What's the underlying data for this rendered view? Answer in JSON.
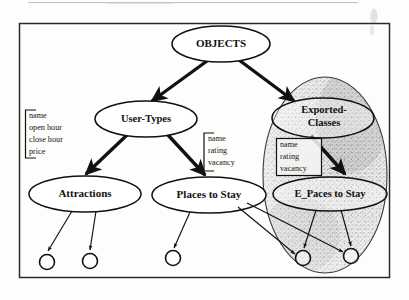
{
  "figure": {
    "kind": "object-hierarchy-diagram",
    "background_color": "#fdfdfc",
    "ink_color": "#111111",
    "shade_color": "#9a9a9a"
  },
  "frame": {
    "name": "outer-border",
    "x": 19,
    "y": 23,
    "width": 371,
    "height": 255
  },
  "scan_artifacts": {
    "top_rule_label": "",
    "top_right_smudge_label": ""
  },
  "nodes": [
    {
      "id": "objects",
      "label": "OBJECTS",
      "cx": 221,
      "cy": 44,
      "rx": 49,
      "ry": 18,
      "font_size": 11,
      "shaded": false,
      "lines": [
        "OBJECTS"
      ]
    },
    {
      "id": "user-types",
      "label": "User-Types",
      "cx": 146,
      "cy": 119,
      "rx": 51,
      "ry": 18,
      "font_size": 10.5,
      "shaded": false,
      "lines": [
        "User-Types"
      ]
    },
    {
      "id": "exported-classes",
      "label": "Exported-Classes",
      "cx": 323,
      "cy": 118,
      "rx": 51,
      "ry": 20,
      "font_size": 10.5,
      "shaded": true,
      "lines": [
        "Exported-",
        "Classes"
      ]
    },
    {
      "id": "attractions",
      "label": "Attractions",
      "cx": 85,
      "cy": 194,
      "rx": 56,
      "ry": 18,
      "font_size": 11,
      "shaded": false,
      "lines": [
        "Attractions"
      ]
    },
    {
      "id": "places-to-stay",
      "label": "Places to Stay",
      "cx": 209,
      "cy": 195,
      "rx": 57,
      "ry": 18,
      "font_size": 11,
      "shaded": false,
      "lines": [
        "Places to Stay"
      ]
    },
    {
      "id": "e-paces-to-stay",
      "label": "E_Paces to Stay",
      "cx": 330,
      "cy": 194,
      "rx": 57,
      "ry": 17,
      "font_size": 10.5,
      "shaded": true,
      "lines": [
        "E_Paces to Stay"
      ]
    }
  ],
  "shaded_region": {
    "name": "exported-classes-region",
    "cx": 325,
    "cy": 175,
    "rx": 62,
    "ry": 98
  },
  "attribute_boxes": [
    {
      "id": "attrs-attractions",
      "style": "bracket",
      "x": 25,
      "y": 110,
      "width": 52,
      "height": 48,
      "items": [
        "name",
        "open hour",
        "close hour",
        "price"
      ],
      "font_size": 8.2
    },
    {
      "id": "attrs-places",
      "style": "bracket",
      "x": 203,
      "y": 133,
      "width": 44,
      "height": 38,
      "items": [
        "name",
        "rating",
        "vacancy"
      ],
      "font_size": 8.2
    },
    {
      "id": "attrs-exported",
      "style": "box",
      "x": 276,
      "y": 138,
      "width": 46,
      "height": 38,
      "items": [
        "name",
        "rating",
        "vacancy"
      ],
      "font_size": 8.2
    }
  ],
  "thick_edges": [
    {
      "id": "objects-to-user-types",
      "from": "objects",
      "to": "user-types",
      "x1": 207,
      "y1": 61,
      "x2": 152,
      "y2": 101
    },
    {
      "id": "objects-to-exported-classes",
      "from": "objects",
      "to": "exported-classes",
      "x1": 239,
      "y1": 60,
      "x2": 294,
      "y2": 101
    },
    {
      "id": "user-types-to-attractions",
      "from": "user-types",
      "to": "attractions",
      "x1": 127,
      "y1": 135,
      "x2": 85,
      "y2": 176
    },
    {
      "id": "user-types-to-places",
      "from": "user-types",
      "to": "places-to-stay",
      "x1": 168,
      "y1": 135,
      "x2": 205,
      "y2": 177
    },
    {
      "id": "exported-classes-to-e-paces",
      "from": "exported-classes",
      "to": "e-paces-to-stay",
      "x1": 311,
      "y1": 135,
      "x2": 345,
      "y2": 175
    }
  ],
  "instance_circles": [
    {
      "id": "inst-attractions-1",
      "cx": 47,
      "cy": 262,
      "r": 7.5,
      "from": "attractions",
      "fx": 72,
      "fy": 212
    },
    {
      "id": "inst-attractions-2",
      "cx": 90,
      "cy": 261,
      "r": 7.5,
      "from": "attractions",
      "fx": 96,
      "fy": 212
    },
    {
      "id": "inst-places-1",
      "cx": 173,
      "cy": 258,
      "r": 7.5,
      "from": "places-to-stay",
      "fx": 190,
      "fy": 212
    },
    {
      "id": "inst-shared-1",
      "cx": 303,
      "cy": 258,
      "r": 7.5,
      "from": "e-paces-to-stay",
      "fx": 316,
      "fy": 210
    },
    {
      "id": "inst-shared-2",
      "cx": 351,
      "cy": 256,
      "r": 7.5,
      "from": "e-paces-to-stay",
      "fx": 340,
      "fy": 211
    }
  ],
  "cross_links": [
    {
      "id": "places-to-shared-1",
      "x1": 239,
      "y1": 206,
      "x2": 296,
      "y2": 255
    },
    {
      "id": "places-to-shared-2",
      "x1": 248,
      "y1": 202,
      "x2": 344,
      "y2": 252
    }
  ]
}
